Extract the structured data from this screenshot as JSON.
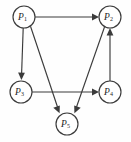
{
  "diagram": {
    "kind": "directed-graph",
    "width": 131,
    "height": 142,
    "background_color": "#fefefe",
    "line_color": "#3b3b3b",
    "node_fill_color": "#ffffff",
    "label_color": "#1d1d1d",
    "nodes": [
      {
        "id": "P1",
        "base": "P",
        "subscript": "1",
        "label": "P1",
        "cx": 24,
        "cy": 17,
        "r": 11
      },
      {
        "id": "P2",
        "base": "P",
        "subscript": "2",
        "label": "P2",
        "cx": 110,
        "cy": 17,
        "r": 11
      },
      {
        "id": "P3",
        "base": "P",
        "subscript": "3",
        "label": "P3",
        "cx": 21,
        "cy": 92,
        "r": 11
      },
      {
        "id": "P4",
        "base": "P",
        "subscript": "4",
        "label": "P4",
        "cx": 110,
        "cy": 92,
        "r": 11
      },
      {
        "id": "P5",
        "base": "P",
        "subscript": "5",
        "label": "P5",
        "cx": 67,
        "cy": 124,
        "r": 11
      }
    ],
    "edges": [
      {
        "id": "e1",
        "from": "P1",
        "to": "P2",
        "directed": true,
        "description": "P1 to P2 top horizontal"
      },
      {
        "id": "e2",
        "from": "P1",
        "to": "P3",
        "directed": true,
        "description": "P1 to P3 left vertical"
      },
      {
        "id": "e3",
        "from": "P1",
        "to": "P5",
        "directed": true,
        "description": "P1 to P5 left diagonal"
      },
      {
        "id": "e4",
        "from": "P3",
        "to": "P4",
        "directed": true,
        "description": "P3 to P4 bottom horizontal"
      },
      {
        "id": "e5",
        "from": "P4",
        "to": "P2",
        "directed": true,
        "description": "P4 to P2 right vertical upward"
      },
      {
        "id": "e6",
        "from": "P2",
        "to": "P5",
        "directed": true,
        "description": "P2 to P5 right diagonal"
      }
    ]
  }
}
